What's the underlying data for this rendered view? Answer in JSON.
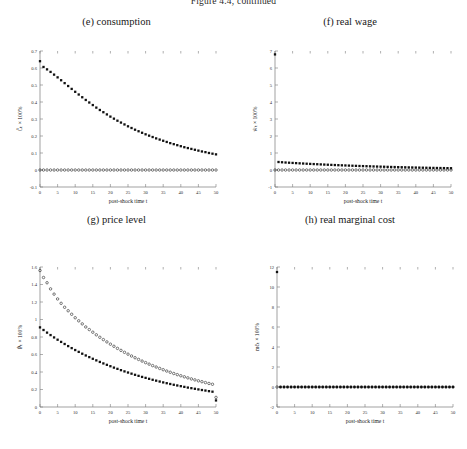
{
  "figure": {
    "caption": "Figure 4.4, continued",
    "caption_clipped": true,
    "background": "#ffffff",
    "marker_color": "#111111",
    "axis_color": "#7a7a7a"
  },
  "common": {
    "xlabel": "post-shock time t",
    "xticks": [
      0,
      5,
      10,
      15,
      20,
      25,
      30,
      35,
      40,
      45,
      50
    ],
    "xlim": [
      0,
      50
    ]
  },
  "chart_data": [
    {
      "id": "panel-e",
      "type": "scatter",
      "title": "(e) consumption",
      "xlabel": "post-shock time t",
      "ylabel": "Ĉₜ × 100%",
      "xlim": [
        0,
        50
      ],
      "ylim": [
        -0.1,
        0.7
      ],
      "xticks": [
        0,
        5,
        10,
        15,
        20,
        25,
        30,
        35,
        40,
        45,
        50
      ],
      "yticks": [
        -0.1,
        0,
        0.1,
        0.2,
        0.3,
        0.4,
        0.5,
        0.6,
        0.7
      ],
      "ytick_labels": [
        "-0.1",
        "0",
        "0.1",
        "0.2",
        "0.3",
        "0.4",
        "0.5",
        "0.6",
        "0.7"
      ],
      "grid": false,
      "legend": null,
      "series": [
        {
          "name": "sticky-price (filled squares)",
          "marker": "filled-square",
          "x": [
            0,
            1,
            2,
            3,
            4,
            5,
            6,
            7,
            8,
            9,
            10,
            11,
            12,
            13,
            14,
            15,
            16,
            17,
            18,
            19,
            20,
            21,
            22,
            23,
            24,
            25,
            26,
            27,
            28,
            29,
            30,
            31,
            32,
            33,
            34,
            35,
            36,
            37,
            38,
            39,
            40,
            41,
            42,
            43,
            44,
            45,
            46,
            47,
            48,
            49,
            50
          ],
          "values": [
            0.64,
            0.606,
            0.592,
            0.577,
            0.561,
            0.545,
            0.528,
            0.511,
            0.494,
            0.477,
            0.46,
            0.444,
            0.428,
            0.412,
            0.397,
            0.382,
            0.367,
            0.353,
            0.34,
            0.327,
            0.314,
            0.302,
            0.29,
            0.279,
            0.268,
            0.257,
            0.247,
            0.237,
            0.228,
            0.219,
            0.21,
            0.202,
            0.194,
            0.186,
            0.179,
            0.172,
            0.165,
            0.158,
            0.152,
            0.146,
            0.14,
            0.134,
            0.129,
            0.124,
            0.119,
            0.114,
            0.109,
            0.105,
            0.1,
            0.096,
            0.092
          ]
        },
        {
          "name": "flexible-price (open circles)",
          "marker": "open-circle",
          "x": [
            0,
            1,
            2,
            3,
            4,
            5,
            6,
            7,
            8,
            9,
            10,
            11,
            12,
            13,
            14,
            15,
            16,
            17,
            18,
            19,
            20,
            21,
            22,
            23,
            24,
            25,
            26,
            27,
            28,
            29,
            30,
            31,
            32,
            33,
            34,
            35,
            36,
            37,
            38,
            39,
            40,
            41,
            42,
            43,
            44,
            45,
            46,
            47,
            48,
            49,
            50
          ],
          "values": [
            0,
            0,
            0,
            0,
            0,
            0,
            0,
            0,
            0,
            0,
            0,
            0,
            0,
            0,
            0,
            0,
            0,
            0,
            0,
            0,
            0,
            0,
            0,
            0,
            0,
            0,
            0,
            0,
            0,
            0,
            0,
            0,
            0,
            0,
            0,
            0,
            0,
            0,
            0,
            0,
            0,
            0,
            0,
            0,
            0,
            0,
            0,
            0,
            0,
            0,
            0
          ]
        }
      ]
    },
    {
      "id": "panel-f",
      "type": "scatter",
      "title": "(f) real wage",
      "xlabel": "post-shock time t",
      "ylabel": "ŵₜ × 100%",
      "xlim": [
        0,
        50
      ],
      "ylim": [
        -1,
        7
      ],
      "xticks": [
        0,
        5,
        10,
        15,
        20,
        25,
        30,
        35,
        40,
        45,
        50
      ],
      "yticks": [
        -1,
        0,
        1,
        2,
        3,
        4,
        5,
        6,
        7
      ],
      "ytick_labels": [
        "-1",
        "0",
        "1",
        "2",
        "3",
        "4",
        "5",
        "6",
        "7"
      ],
      "grid": false,
      "legend": null,
      "series": [
        {
          "name": "sticky-price (filled squares)",
          "marker": "filled-square",
          "x": [
            0,
            1,
            2,
            3,
            4,
            5,
            6,
            7,
            8,
            9,
            10,
            11,
            12,
            13,
            14,
            15,
            16,
            17,
            18,
            19,
            20,
            21,
            22,
            23,
            24,
            25,
            26,
            27,
            28,
            29,
            30,
            31,
            32,
            33,
            34,
            35,
            36,
            37,
            38,
            39,
            40,
            41,
            42,
            43,
            44,
            45,
            46,
            47,
            48,
            49,
            50
          ],
          "values": [
            6.8,
            0.47,
            0.455,
            0.44,
            0.428,
            0.416,
            0.404,
            0.392,
            0.381,
            0.37,
            0.359,
            0.349,
            0.339,
            0.329,
            0.319,
            0.31,
            0.301,
            0.292,
            0.283,
            0.275,
            0.267,
            0.259,
            0.251,
            0.244,
            0.236,
            0.229,
            0.222,
            0.216,
            0.209,
            0.203,
            0.197,
            0.191,
            0.185,
            0.179,
            0.174,
            0.168,
            0.163,
            0.158,
            0.153,
            0.149,
            0.144,
            0.14,
            0.135,
            0.131,
            0.127,
            0.123,
            0.119,
            0.116,
            0.112,
            0.109,
            0.105
          ]
        },
        {
          "name": "flexible-price (open circles)",
          "marker": "open-circle",
          "x": [
            0,
            1,
            2,
            3,
            4,
            5,
            6,
            7,
            8,
            9,
            10,
            11,
            12,
            13,
            14,
            15,
            16,
            17,
            18,
            19,
            20,
            21,
            22,
            23,
            24,
            25,
            26,
            27,
            28,
            29,
            30,
            31,
            32,
            33,
            34,
            35,
            36,
            37,
            38,
            39,
            40,
            41,
            42,
            43,
            44,
            45,
            46,
            47,
            48,
            49,
            50
          ],
          "values": [
            0,
            0,
            0,
            0,
            0,
            0,
            0,
            0,
            0,
            0,
            0,
            0,
            0,
            0,
            0,
            0,
            0,
            0,
            0,
            0,
            0,
            0,
            0,
            0,
            0,
            0,
            0,
            0,
            0,
            0,
            0,
            0,
            0,
            0,
            0,
            0,
            0,
            0,
            0,
            0,
            0,
            0,
            0,
            0,
            0,
            0,
            0,
            0,
            0,
            0,
            0
          ]
        }
      ]
    },
    {
      "id": "panel-g",
      "type": "scatter",
      "title": "(g) price level",
      "xlabel": "post-shock time t",
      "ylabel": "P̂ₜ × 100%",
      "xlim": [
        0,
        50
      ],
      "ylim": [
        0,
        1.6
      ],
      "xticks": [
        0,
        5,
        10,
        15,
        20,
        25,
        30,
        35,
        40,
        45,
        50
      ],
      "yticks": [
        0,
        0.2,
        0.4,
        0.6,
        0.8,
        1,
        1.2,
        1.4,
        1.6
      ],
      "ytick_labels": [
        "0",
        "0.2",
        "0.4",
        "0.6",
        "0.8",
        "1",
        "1.2",
        "1.4",
        "1.6"
      ],
      "grid": false,
      "legend": null,
      "series": [
        {
          "name": "flexible-price (open circles)",
          "marker": "open-circle",
          "x": [
            0,
            1,
            2,
            3,
            4,
            5,
            6,
            7,
            8,
            9,
            10,
            11,
            12,
            13,
            14,
            15,
            16,
            17,
            18,
            19,
            20,
            21,
            22,
            23,
            24,
            25,
            26,
            27,
            28,
            29,
            30,
            31,
            32,
            33,
            34,
            35,
            36,
            37,
            38,
            39,
            40,
            41,
            42,
            43,
            44,
            45,
            46,
            47,
            48,
            49,
            50
          ],
          "values": [
            1.56,
            1.48,
            1.42,
            1.35,
            1.29,
            1.235,
            1.185,
            1.14,
            1.1,
            1.06,
            1.02,
            0.985,
            0.95,
            0.915,
            0.885,
            0.855,
            0.825,
            0.797,
            0.77,
            0.744,
            0.718,
            0.694,
            0.67,
            0.647,
            0.625,
            0.604,
            0.583,
            0.563,
            0.544,
            0.525,
            0.507,
            0.49,
            0.473,
            0.457,
            0.441,
            0.426,
            0.411,
            0.397,
            0.383,
            0.37,
            0.357,
            0.345,
            0.333,
            0.321,
            0.31,
            0.299,
            0.289,
            0.279,
            0.269,
            0.26,
            0.11
          ]
        },
        {
          "name": "sticky-price (filled squares)",
          "marker": "filled-square",
          "x": [
            0,
            1,
            2,
            3,
            4,
            5,
            6,
            7,
            8,
            9,
            10,
            11,
            12,
            13,
            14,
            15,
            16,
            17,
            18,
            19,
            20,
            21,
            22,
            23,
            24,
            25,
            26,
            27,
            28,
            29,
            30,
            31,
            32,
            33,
            34,
            35,
            36,
            37,
            38,
            39,
            40,
            41,
            42,
            43,
            44,
            45,
            46,
            47,
            48,
            49,
            50
          ],
          "values": [
            0.91,
            0.88,
            0.85,
            0.822,
            0.795,
            0.769,
            0.744,
            0.72,
            0.696,
            0.673,
            0.651,
            0.63,
            0.609,
            0.589,
            0.57,
            0.551,
            0.533,
            0.515,
            0.498,
            0.482,
            0.466,
            0.45,
            0.436,
            0.421,
            0.407,
            0.394,
            0.381,
            0.368,
            0.356,
            0.344,
            0.333,
            0.322,
            0.311,
            0.301,
            0.291,
            0.281,
            0.272,
            0.263,
            0.254,
            0.246,
            0.238,
            0.23,
            0.222,
            0.215,
            0.208,
            0.201,
            0.194,
            0.188,
            0.181,
            0.175,
            0.075
          ]
        }
      ]
    },
    {
      "id": "panel-h",
      "type": "scatter",
      "title": "(h) real marginal cost",
      "xlabel": "post-shock time t",
      "ylabel": "mĉₜ × 100%",
      "xlim": [
        0,
        50
      ],
      "ylim": [
        -2,
        12
      ],
      "xticks": [
        0,
        5,
        10,
        15,
        20,
        25,
        30,
        35,
        40,
        45,
        50
      ],
      "yticks": [
        -2,
        0,
        2,
        4,
        6,
        8,
        10,
        12
      ],
      "ytick_labels": [
        "-2",
        "0",
        "2",
        "4",
        "6",
        "8",
        "10",
        "12"
      ],
      "grid": false,
      "legend": null,
      "series": [
        {
          "name": "sticky-price (filled squares)",
          "marker": "filled-square",
          "x": [
            0,
            1,
            2,
            3,
            4,
            5,
            6,
            7,
            8,
            9,
            10,
            11,
            12,
            13,
            14,
            15,
            16,
            17,
            18,
            19,
            20,
            21,
            22,
            23,
            24,
            25,
            26,
            27,
            28,
            29,
            30,
            31,
            32,
            33,
            34,
            35,
            36,
            37,
            38,
            39,
            40,
            41,
            42,
            43,
            44,
            45,
            46,
            47,
            48,
            49,
            50
          ],
          "values": [
            11.5,
            0,
            0,
            0,
            0,
            0,
            0,
            0,
            0,
            0,
            0,
            0,
            0,
            0,
            0,
            0,
            0,
            0,
            0,
            0,
            0,
            0,
            0,
            0,
            0,
            0,
            0,
            0,
            0,
            0,
            0,
            0,
            0,
            0,
            0,
            0,
            0,
            0,
            0,
            0,
            0,
            0,
            0,
            0,
            0,
            0,
            0,
            0,
            0,
            0,
            0
          ]
        },
        {
          "name": "flexible-price (open circles)",
          "marker": "open-circle",
          "x": [
            0,
            1,
            2,
            3,
            4,
            5,
            6,
            7,
            8,
            9,
            10,
            11,
            12,
            13,
            14,
            15,
            16,
            17,
            18,
            19,
            20,
            21,
            22,
            23,
            24,
            25,
            26,
            27,
            28,
            29,
            30,
            31,
            32,
            33,
            34,
            35,
            36,
            37,
            38,
            39,
            40,
            41,
            42,
            43,
            44,
            45,
            46,
            47,
            48,
            49,
            50
          ],
          "values": [
            0,
            0,
            0,
            0,
            0,
            0,
            0,
            0,
            0,
            0,
            0,
            0,
            0,
            0,
            0,
            0,
            0,
            0,
            0,
            0,
            0,
            0,
            0,
            0,
            0,
            0,
            0,
            0,
            0,
            0,
            0,
            0,
            0,
            0,
            0,
            0,
            0,
            0,
            0,
            0,
            0,
            0,
            0,
            0,
            0,
            0,
            0,
            0,
            0,
            0,
            0
          ]
        }
      ]
    }
  ]
}
